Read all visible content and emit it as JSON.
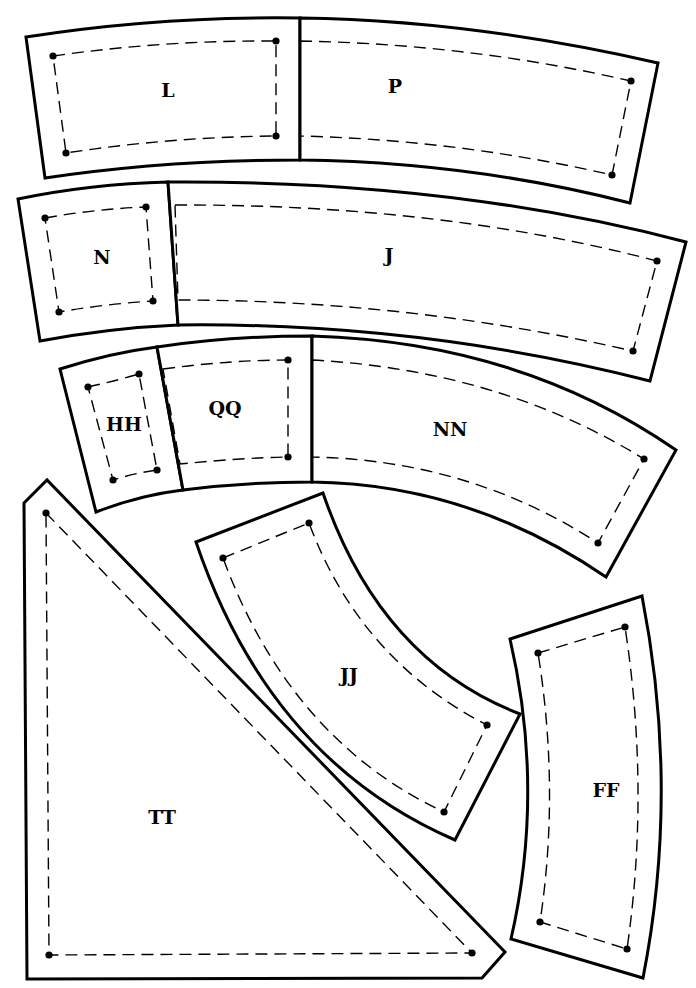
{
  "diagram": {
    "type": "quilt-template-pieces",
    "colors": {
      "line": "#000000",
      "background": "#ffffff"
    },
    "pieces": [
      {
        "label": "L",
        "label_pos": [
          168,
          92
        ],
        "cut": "M26,37 Q160,16 300,18 L300,160 Q165,160 45,178 Z",
        "seam": "M53,56 Q165,40 276,41 L276,136 Q170,137 66,153 Z",
        "dots": [
          [
            53,
            56
          ],
          [
            276,
            41
          ],
          [
            276,
            136
          ],
          [
            66,
            153
          ]
        ]
      },
      {
        "label": "P",
        "label_pos": [
          395,
          88
        ],
        "cut": "M300,18 Q470,20 658,63 L630,203 Q470,162 300,160 Z",
        "seam": "M300,41 Q470,44 631,81 L612,175 Q460,140 300,136 Z",
        "dots": [
          [
            631,
            81
          ],
          [
            612,
            175
          ]
        ]
      },
      {
        "label": "N",
        "label_pos": [
          102,
          259
        ],
        "cut": "M18,199 Q90,184 168,182 L178,325 Q110,328 40,341 Z",
        "seam": "M45,218 Q95,209 146,207 L153,301 Q105,304 59,312 Z",
        "dots": [
          [
            45,
            218
          ],
          [
            146,
            207
          ],
          [
            153,
            301
          ],
          [
            59,
            312
          ]
        ]
      },
      {
        "label": "J",
        "label_pos": [
          389,
          257
        ],
        "cut": "M168,182 Q450,180 686,242 L650,381 Q420,322 178,325 Z",
        "seam": "M175,205 Q440,204 657,261 L633,351 Q410,300 178,300 Z",
        "dots": [
          [
            657,
            261
          ],
          [
            633,
            351
          ]
        ]
      },
      {
        "label": "HH",
        "label_pos": [
          124,
          426
        ],
        "cut": "M60,369 Q110,353 157,347 L183,490 Q140,495 96,512 Z",
        "seam": "M88,387 Q115,381 139,374 L157,470 Q135,473 113,480 Z",
        "dots": [
          [
            88,
            387
          ],
          [
            139,
            374
          ],
          [
            157,
            470
          ],
          [
            113,
            480
          ]
        ]
      },
      {
        "label": "QQ",
        "label_pos": [
          225,
          410
        ],
        "cut": "M157,347 Q230,336 312,336 L312,482 Q245,482 183,490 Z",
        "seam": "M163,369 Q230,360 288,360 L288,457 Q240,458 180,464 Z",
        "dots": [
          [
            288,
            360
          ],
          [
            288,
            457
          ]
        ]
      },
      {
        "label": "NN",
        "label_pos": [
          450,
          431
        ],
        "cut": "M312,336 Q520,342 676,450 L606,577 Q470,484 312,482 Z",
        "seam": "M312,360 Q500,370 644,459 L598,543 Q470,460 312,457 Z",
        "dots": [
          [
            644,
            459
          ],
          [
            598,
            543
          ]
        ]
      },
      {
        "label": "TT",
        "label_pos": [
          162,
          819
        ],
        "cut": "M24,503 L47,480 L505,952 L482,978 L27,979 Z",
        "seam": "M46,513 L472,953 L49,955 Z",
        "dots": [
          [
            46,
            513
          ],
          [
            472,
            953
          ],
          [
            49,
            955
          ]
        ]
      },
      {
        "label": "JJ",
        "label_pos": [
          349,
          677
        ],
        "cut": "M196,542 L323,493 Q380,660 520,714 L455,840 Q270,760 196,542 Z",
        "seam": "M223,558 L309,523 Q360,660 487,725 L444,812 Q290,740 223,558 Z",
        "dots": [
          [
            223,
            558
          ],
          [
            309,
            523
          ],
          [
            487,
            725
          ],
          [
            444,
            812
          ]
        ]
      },
      {
        "label": "FF",
        "label_pos": [
          606,
          792
        ],
        "cut": "M510,639 L642,596 Q680,790 643,978 L511,939 Q545,790 510,639 Z",
        "seam": "M538,653 L625,627 Q650,790 627,949 L540,922 Q560,790 538,653 Z",
        "dots": [
          [
            538,
            653
          ],
          [
            625,
            627
          ],
          [
            627,
            949
          ],
          [
            540,
            922
          ]
        ]
      }
    ]
  }
}
